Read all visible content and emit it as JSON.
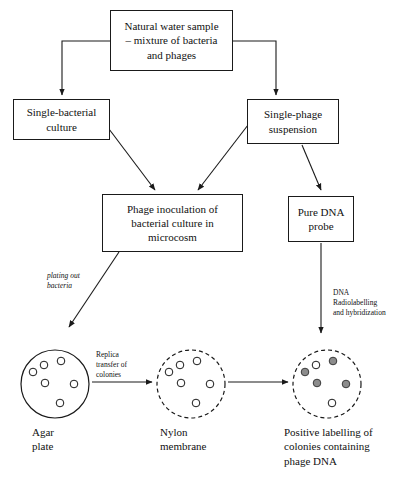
{
  "diagram": {
    "stroke_color": "#1a1a1a",
    "colony_fill_color": "#8c8c8c",
    "background_color": "#ffffff"
  },
  "boxes": {
    "natural_water_sample": "Natural  water sample\n– mixture of bacteria\nand phages",
    "single_bacterial_culture": "Single-bacterial\nculture",
    "single_phage_suspension": "Single-phage\nsuspension",
    "phage_inoculation": "Phage inoculation of\nbacterial culture in\nmicrocosm",
    "pure_dna_probe": "Pure DNA\nprobe"
  },
  "edge_labels": {
    "plating_out_bacteria": "plating out\nbacteria",
    "dna_radiolabelling": "DNA\nRadiolabelling\nand hybridization",
    "replica_transfer": "Replica\ntransfer of\ncolonies"
  },
  "plates": [
    {
      "id": "agar-plate",
      "caption": "Agar\nplate",
      "border_style": "solid",
      "colonies": [
        {
          "cx": 14,
          "cy": 24,
          "filled": false
        },
        {
          "cx": 25,
          "cy": 17,
          "filled": false
        },
        {
          "cx": 42,
          "cy": 13,
          "filled": false
        },
        {
          "cx": 26,
          "cy": 35,
          "filled": false
        },
        {
          "cx": 55,
          "cy": 36,
          "filled": false
        },
        {
          "cx": 41,
          "cy": 55,
          "filled": false
        }
      ]
    },
    {
      "id": "nylon-membrane",
      "caption": "Nylon\nmembrane",
      "border_style": "dashed",
      "colonies": [
        {
          "cx": 14,
          "cy": 24,
          "filled": false
        },
        {
          "cx": 25,
          "cy": 17,
          "filled": false
        },
        {
          "cx": 42,
          "cy": 13,
          "filled": false
        },
        {
          "cx": 26,
          "cy": 35,
          "filled": false
        },
        {
          "cx": 55,
          "cy": 36,
          "filled": false
        },
        {
          "cx": 41,
          "cy": 55,
          "filled": false
        }
      ]
    },
    {
      "id": "positive-labelling-plate",
      "caption": "Positive labelling of\ncolonies containing\nphage DNA",
      "border_style": "dashed",
      "colonies": [
        {
          "cx": 14,
          "cy": 24,
          "filled": true
        },
        {
          "cx": 25,
          "cy": 17,
          "filled": false
        },
        {
          "cx": 42,
          "cy": 13,
          "filled": true
        },
        {
          "cx": 26,
          "cy": 35,
          "filled": true
        },
        {
          "cx": 55,
          "cy": 36,
          "filled": true
        },
        {
          "cx": 41,
          "cy": 55,
          "filled": false
        }
      ]
    }
  ]
}
